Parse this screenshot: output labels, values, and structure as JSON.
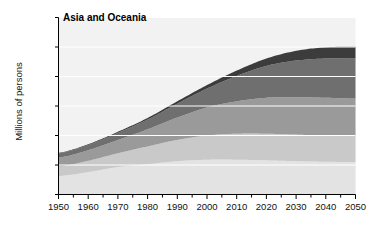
{
  "chart_data": {
    "type": "area",
    "title": "Asia and Oceania",
    "xlabel": "",
    "ylabel": "Millions of persons",
    "x": [
      1950,
      1960,
      1970,
      1980,
      1990,
      2000,
      2010,
      2020,
      2030,
      2040,
      2050
    ],
    "xlim": [
      1950,
      2050
    ],
    "ylim": [
      0,
      6000
    ],
    "yticks": [
      0,
      1000,
      2000,
      3000,
      4000,
      5000,
      6000
    ],
    "ytick_labels": [
      "0",
      "1,000",
      "2,000",
      "3,000",
      "4,000",
      "5,000",
      "6,000"
    ],
    "xticks": [
      1950,
      1960,
      1970,
      1980,
      1990,
      2000,
      2010,
      2020,
      2030,
      2040,
      2050
    ],
    "xtick_labels": [
      "1950",
      "1960",
      "1970",
      "1980",
      "1990",
      "2000",
      "2010",
      "2020",
      "2030",
      "2040",
      "2050"
    ],
    "grid": true,
    "grid_color": "#ffffff",
    "legend": "none",
    "stacked": true,
    "plot_background": "#f2f2f2",
    "series": [
      {
        "name": "band-1-lightest",
        "color": "#e3e3e3",
        "values": [
          620,
          760,
          930,
          1030,
          1130,
          1180,
          1180,
          1160,
          1130,
          1110,
          1100
        ]
      },
      {
        "name": "band-2-light",
        "color": "#c9c9c9",
        "values": [
          330,
          380,
          470,
          600,
          720,
          820,
          880,
          900,
          900,
          890,
          880
        ]
      },
      {
        "name": "band-3-medium",
        "color": "#9a9a9a",
        "values": [
          300,
          360,
          450,
          580,
          760,
          950,
          1100,
          1220,
          1270,
          1280,
          1270
        ]
      },
      {
        "name": "band-4-dark",
        "color": "#6f6f6f",
        "values": [
          140,
          180,
          240,
          330,
          470,
          640,
          860,
          1080,
          1240,
          1330,
          1360
        ]
      },
      {
        "name": "band-5-darkest",
        "color": "#3c3c3c",
        "values": [
          20,
          25,
          35,
          55,
          80,
          120,
          180,
          250,
          330,
          380,
          400
        ]
      }
    ],
    "totals": [
      1410,
      1705,
      2125,
      2595,
      3160,
      3710,
      4200,
      4610,
      4870,
      4990,
      5010
    ]
  },
  "axis": {
    "ylabel_text": "Millions of persons"
  }
}
